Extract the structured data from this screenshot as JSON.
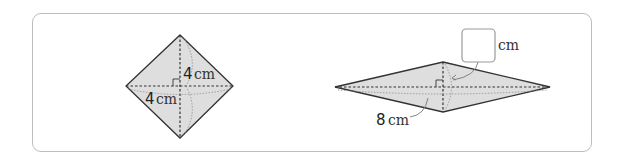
{
  "figure": {
    "type": "rhombus-diagonals",
    "colors": {
      "fill": "#dedede",
      "stroke": "#333333",
      "panel_border": "#bdbdbd",
      "arc": "#8a8a8a"
    },
    "rhombus_a": {
      "vertical_label_num": "4",
      "vertical_label_unit": "cm",
      "horizontal_label_num": "4",
      "horizontal_label_unit": "cm"
    },
    "rhombus_b": {
      "horizontal_label_num": "8",
      "horizontal_label_unit": "cm",
      "vertical_answer_box": "",
      "vertical_label_unit": "cm"
    }
  }
}
